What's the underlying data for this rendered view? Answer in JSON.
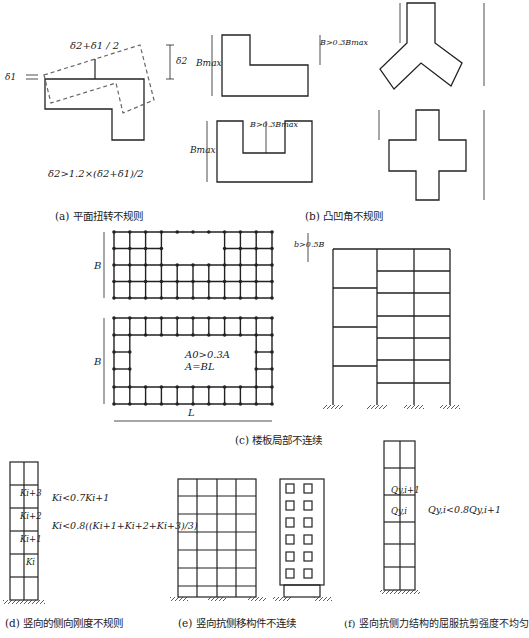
{
  "panels": {
    "a": {
      "caption": "(a) 平面扭转不规则",
      "top_label": "δ2+δ1 / 2",
      "d1": "δ1",
      "d2": "δ2",
      "formula": "δ2>1.2×(δ2+δ1)/2"
    },
    "b": {
      "caption": "(b) 凸凹角不规则",
      "bmax": "Bmax",
      "b_cond": "B>0.3Bmax"
    },
    "c": {
      "caption": "(c) 楼板局部不连续",
      "b_label": "B",
      "l_label": "L",
      "a0": "A0>0.3A",
      "a_def": "A=BL",
      "b_cond": "b>0.5B"
    },
    "d": {
      "caption": "(d) 竖向的侧向刚度不规则",
      "k3": "Ki+3",
      "k2": "Ki+2",
      "k1": "Ki+1",
      "k0": "Ki",
      "f1": "Ki<0.7Ki+1",
      "f2": "Ki<0.8((Ki+1+Ki+2+Ki+3)/3)"
    },
    "e": {
      "caption": "(e) 竖向抗侧移构件不连续"
    },
    "f": {
      "caption": "(f) 竖向抗侧力结构的屈服抗剪强度不均匀",
      "q1": "Qy,i+1",
      "q0": "Qy,i",
      "formula": "Qy,i<0.8Qy,i+1"
    }
  }
}
